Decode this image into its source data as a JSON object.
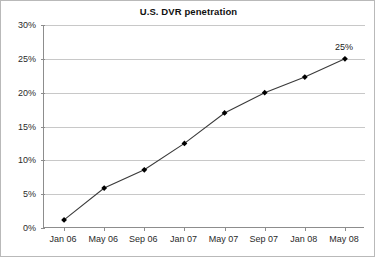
{
  "chart_data": {
    "type": "line",
    "title": "U.S. DVR penetration",
    "subtitle": "",
    "xlabel": "",
    "ylabel": "",
    "categories": [
      "Jan 06",
      "May 06",
      "Sep 06",
      "Jan 07",
      "May 07",
      "Sep 07",
      "Jan 08",
      "May 08"
    ],
    "values": [
      1.2,
      5.9,
      8.6,
      12.5,
      17.0,
      20.0,
      22.3,
      25.0
    ],
    "series": [
      {
        "name": "U.S. DVR penetration",
        "values": [
          1.2,
          5.9,
          8.6,
          12.5,
          17.0,
          20.0,
          22.3,
          25.0
        ]
      }
    ],
    "ylim": [
      0,
      30
    ],
    "ytick_labels": [
      "0%",
      "5%",
      "10%",
      "15%",
      "20%",
      "25%",
      "30%"
    ],
    "ytick_values": [
      0,
      5,
      10,
      15,
      20,
      25,
      30
    ],
    "grid": true,
    "legend": false,
    "legend_position": "none",
    "annotations": [
      {
        "text": "25%",
        "category": "May 08",
        "value": 25.0
      }
    ],
    "marker": "filled-diamond",
    "line_color": "#3a3a3a",
    "marker_color": "#000000",
    "grid_color": "#c8c8c8",
    "axis_color": "#8d8d8d",
    "background_color": "#ffffff"
  }
}
